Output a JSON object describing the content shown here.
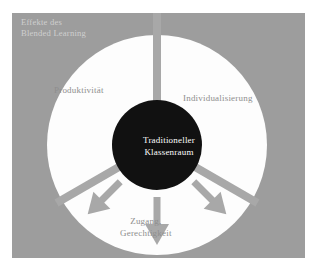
{
  "figure": {
    "caption": {
      "line1": "Effekte des",
      "line2": "Blended Learning"
    },
    "center_node": {
      "name": "traditional-classroom",
      "line1": "Traditioneller",
      "line2": "Klassenraum"
    },
    "sectors": [
      {
        "id": "produktivitaet",
        "label": "Produktivität",
        "arrow_direction": "up-left"
      },
      {
        "id": "individualisierung",
        "label": "Individualisierung",
        "arrow_direction": "up-right"
      },
      {
        "id": "zugang-gerechtigkeit",
        "label_line1": "Zugang,",
        "label_line2": "Gerechtigkeit",
        "arrow_direction": "down"
      }
    ],
    "colors": {
      "page_background": "#ffffff",
      "panel_background": "#9d9d9d",
      "wheel_fill": "#fdfdfd",
      "center_fill": "#111111",
      "divider": "#a8a8a8",
      "arrow": "#a8a8a8",
      "label_text": "#8e8e8e",
      "caption_text": "#cfcfcf",
      "center_text": "#ffffff"
    }
  }
}
